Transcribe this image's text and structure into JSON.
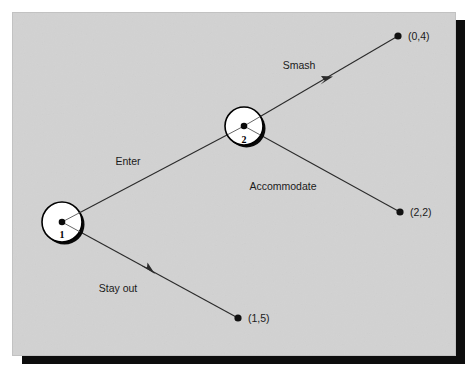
{
  "figure": {
    "kind": "extensive-form-game-tree",
    "caption": "",
    "panel": {
      "background_color": "#d6d6d6",
      "border_color": "#bdbdbd",
      "shadow_color": "#0d0d0d",
      "page_color": "#ffffff"
    },
    "line_color": "#2b2b2b",
    "node_fill": "#ffffff",
    "node_stroke": "#000000"
  },
  "nodes": [
    {
      "id": "n1",
      "label": "1",
      "player": "1",
      "cx": 62,
      "cy": 222,
      "r": 20
    },
    {
      "id": "n2",
      "label": "2",
      "player": "2",
      "cx": 244,
      "cy": 126,
      "r": 19
    }
  ],
  "edges": [
    {
      "id": "e-enter",
      "label": "Enter",
      "from": "n1",
      "to": "n2",
      "label_x": 128,
      "label_y": 165,
      "has_arrowhead": false
    },
    {
      "id": "e-stay-out",
      "label": "Stay out",
      "from": "n1",
      "to": "t-1-5",
      "label_x": 118,
      "label_y": 292,
      "has_arrowhead": true,
      "arrow_x": 149,
      "arrow_y": 270
    },
    {
      "id": "e-smash",
      "label": "Smash",
      "from": "n2",
      "to": "t-0-4",
      "label_x": 299,
      "label_y": 69,
      "has_arrowhead": true,
      "arrow_x": 327,
      "arrow_y": 81
    },
    {
      "id": "e-accommodate",
      "label": "Accommodate",
      "from": "n2",
      "to": "t-2-2",
      "label_x": 283,
      "label_y": 190,
      "has_arrowhead": false
    }
  ],
  "terminals": [
    {
      "id": "t-0-4",
      "payoff": "(0,4)",
      "dot_x": 398,
      "dot_y": 36,
      "label_x": 408,
      "label_y": 40,
      "r": 3.6
    },
    {
      "id": "t-2-2",
      "payoff": "(2,2)",
      "dot_x": 400,
      "dot_y": 212,
      "label_x": 410,
      "label_y": 216,
      "r": 3.6
    },
    {
      "id": "t-1-5",
      "payoff": "(1,5)",
      "dot_x": 238,
      "dot_y": 318,
      "label_x": 248,
      "label_y": 322,
      "r": 3.6
    }
  ]
}
